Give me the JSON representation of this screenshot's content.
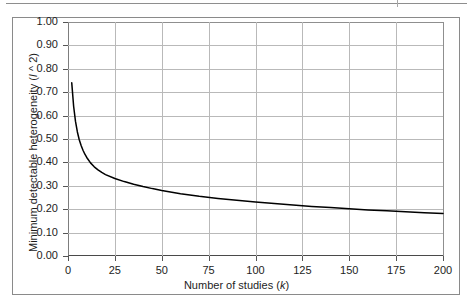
{
  "figure": {
    "top_rule": "",
    "frame": ""
  },
  "axes": {
    "y_ticks": [
      "0.00",
      "0.10",
      "0.20",
      "0.30",
      "0.40",
      "0.50",
      "0.60",
      "0.70",
      "0.80",
      "0.90",
      "1.00"
    ],
    "x_ticks": [
      "0",
      "25",
      "50",
      "75",
      "100",
      "125",
      "150",
      "175",
      "200"
    ],
    "y_title_prefix": "Minimum detectable heterogeneity (",
    "y_title_italic": "I",
    "y_title_suffix": " ^ 2)",
    "x_title_prefix": "Number of studies (",
    "x_title_italic": "k",
    "x_title_suffix": ")"
  },
  "colors": {
    "curve": "#000000",
    "grid": "#b9b9b9",
    "axis": "#4a4a4a",
    "frame": "#8a8a8a",
    "text": "#1d1d1d",
    "background": "#ffffff"
  },
  "chart_data": {
    "type": "line",
    "title": "",
    "subtitle": "",
    "xlabel": "Number of studies (k)",
    "ylabel": "Minimum detectable heterogeneity (I ^ 2)",
    "xlim": [
      0,
      200
    ],
    "ylim": [
      0,
      1.0
    ],
    "xticks": [
      0,
      25,
      50,
      75,
      100,
      125,
      150,
      175,
      200
    ],
    "yticks": [
      0.0,
      0.1,
      0.2,
      0.3,
      0.4,
      0.5,
      0.6,
      0.7,
      0.8,
      0.9,
      1.0
    ],
    "grid": true,
    "legend": null,
    "series": [
      {
        "name": "Minimum detectable heterogeneity",
        "x": [
          2,
          3,
          4,
          5,
          6,
          7,
          8,
          9,
          10,
          12,
          14,
          16,
          18,
          20,
          25,
          30,
          35,
          40,
          45,
          50,
          60,
          70,
          80,
          90,
          100,
          110,
          120,
          130,
          140,
          150,
          160,
          170,
          180,
          190,
          200
        ],
        "y": [
          0.74,
          0.64,
          0.575,
          0.53,
          0.497,
          0.472,
          0.452,
          0.435,
          0.421,
          0.398,
          0.381,
          0.368,
          0.357,
          0.348,
          0.331,
          0.318,
          0.307,
          0.297,
          0.288,
          0.28,
          0.266,
          0.255,
          0.246,
          0.238,
          0.231,
          0.224,
          0.218,
          0.212,
          0.207,
          0.202,
          0.197,
          0.193,
          0.189,
          0.185,
          0.182
        ]
      }
    ],
    "annotations": []
  }
}
